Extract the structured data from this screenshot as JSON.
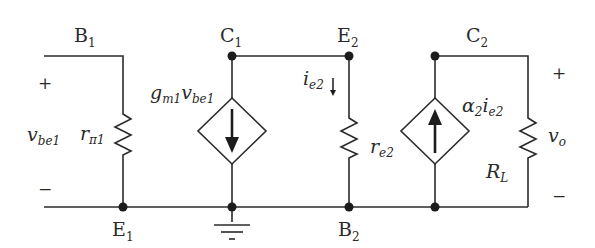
{
  "diagram": {
    "type": "small-signal equivalent circuit",
    "nodes": {
      "B1": {
        "main": "B",
        "sub": "1"
      },
      "C1": {
        "main": "C",
        "sub": "1"
      },
      "E2": {
        "main": "E",
        "sub": "2"
      },
      "C2": {
        "main": "C",
        "sub": "2"
      },
      "E1": {
        "main": "E",
        "sub": "1"
      },
      "B2": {
        "main": "B",
        "sub": "2"
      }
    },
    "input_voltage": {
      "main": "v",
      "sub": "be1",
      "plus": "+",
      "minus": "−"
    },
    "output_voltage": {
      "main": "v",
      "sub": "o",
      "plus": "+",
      "minus": "−"
    },
    "components": {
      "r_pi1": {
        "main": "r",
        "sub": "π1"
      },
      "gm_source": {
        "g": "g",
        "g_sub": "m1",
        "v": "v",
        "v_sub": "be1",
        "direction": "down"
      },
      "ie2_current": {
        "main": "i",
        "sub": "e2",
        "direction": "down"
      },
      "r_e2": {
        "main": "r",
        "sub": "e2"
      },
      "alpha_source": {
        "alpha": "α",
        "alpha_sub": "2",
        "i": "i",
        "i_sub": "e2",
        "direction": "up"
      },
      "R_L": {
        "main": "R",
        "sub": "L"
      }
    },
    "ground": "ground at C1/E1 bottom node"
  }
}
